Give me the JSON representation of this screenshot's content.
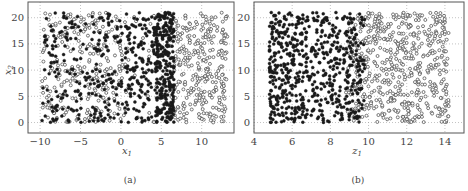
{
  "figure": {
    "panels": [
      {
        "id": "a",
        "caption": "(a)",
        "xlabel": "x",
        "xlabel_sub": "1",
        "ylabel": "x",
        "ylabel_sub": "2"
      },
      {
        "id": "b",
        "caption": "(b)",
        "xlabel": "z",
        "xlabel_sub": "1",
        "ylabel": "",
        "ylabel_sub": ""
      }
    ]
  },
  "chart_data": [
    {
      "type": "scatter",
      "title": "(a)",
      "xlabel": "x1",
      "ylabel": "x2",
      "xlim": [
        -11.5,
        14
      ],
      "ylim": [
        -2,
        23
      ],
      "xticks": [
        -10,
        -5,
        0,
        5,
        10
      ],
      "yticks": [
        0,
        5,
        10,
        15,
        20
      ],
      "grid": true,
      "gridstyle": "dotted",
      "series": [
        {
          "name": "class 1 (filled)",
          "marker": "filled-circle",
          "color": "#1a1a1a",
          "description": "Dense band in x1 ≈ 0.5–6.5, sparser points spread across x1 ≈ -10–0, x2 ≈ 0–21",
          "x_range": [
            -9.8,
            6.6
          ],
          "y_range": [
            0,
            21
          ],
          "approx_count": 650
        },
        {
          "name": "class 2 (open)",
          "marker": "open-circle",
          "color": "#555555",
          "description": "Spread across x1 ≈ -10–5 and concentrated at x1 ≈ 6.5–13, x2 ≈ 0–21",
          "x_range": [
            -9.8,
            13.2
          ],
          "y_range": [
            0,
            21
          ],
          "approx_count": 600
        }
      ]
    },
    {
      "type": "scatter",
      "title": "(b)",
      "xlabel": "z1",
      "ylabel": "",
      "xlim": [
        4,
        15
      ],
      "ylim": [
        -2,
        23
      ],
      "xticks": [
        4,
        6,
        8,
        10,
        12,
        14
      ],
      "yticks": [
        0,
        5,
        10,
        15,
        20
      ],
      "grid": true,
      "gridstyle": "dotted",
      "series": [
        {
          "name": "class 1 (filled)",
          "marker": "filled-circle",
          "color": "#1a1a1a",
          "description": "Concentrated at z1 ≈ 4.8–9.5, y ≈ 0–21",
          "x_range": [
            4.8,
            9.8
          ],
          "y_range": [
            0,
            21
          ],
          "approx_count": 650
        },
        {
          "name": "class 2 (open)",
          "marker": "open-circle",
          "color": "#555555",
          "description": "Concentrated at z1 ≈ 9–14.2, y ≈ 0–21",
          "x_range": [
            8.8,
            14.2
          ],
          "y_range": [
            0,
            21
          ],
          "approx_count": 600
        }
      ]
    }
  ]
}
